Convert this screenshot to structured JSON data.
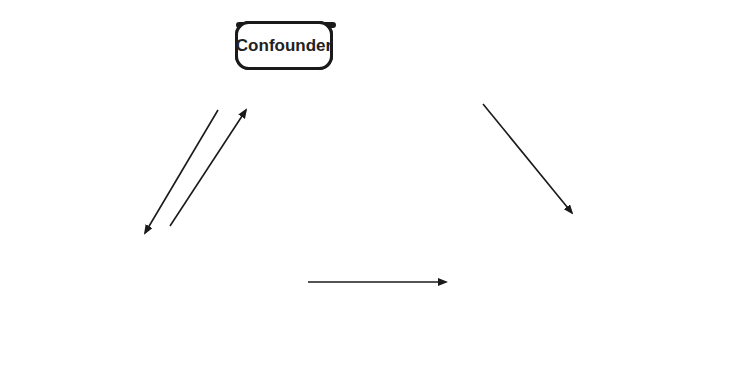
{
  "diagram": {
    "nodes": {
      "confounder": "Confounder",
      "exposure": "Exposure",
      "outcome": "Outcome"
    },
    "edge_labels": {
      "association": "Association",
      "risk_factor": "Risk factor",
      "relationship": "Relationship of interest"
    },
    "edges": [
      {
        "from": "confounder",
        "to": "exposure",
        "label": "Association"
      },
      {
        "from": "exposure",
        "to": "confounder",
        "label": "Association"
      },
      {
        "from": "confounder",
        "to": "outcome",
        "label": "Risk factor"
      },
      {
        "from": "exposure",
        "to": "outcome",
        "label": "Relationship of interest"
      }
    ]
  }
}
